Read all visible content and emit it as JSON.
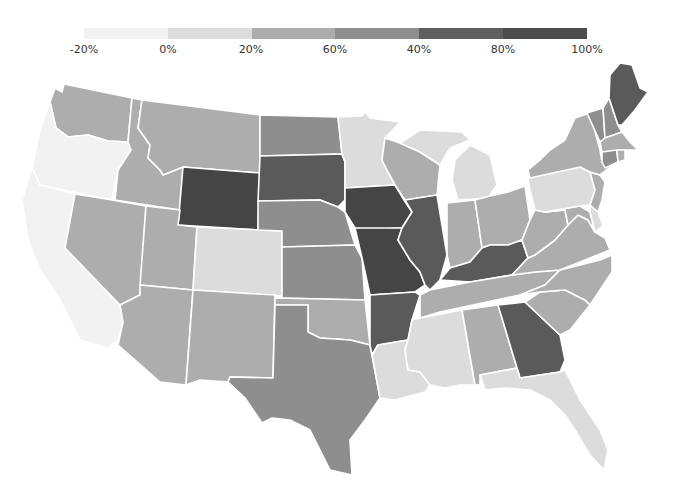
{
  "legend": {
    "segments": [
      {
        "color": "#f2f2f2"
      },
      {
        "color": "#dcdcdc"
      },
      {
        "color": "#adadad"
      },
      {
        "color": "#8e8e8e"
      },
      {
        "color": "#5e5e5e"
      },
      {
        "color": "#4c4c4c"
      }
    ],
    "labels": [
      {
        "text": "-20%",
        "x": 84
      },
      {
        "text": "0%",
        "x": 168
      },
      {
        "text": "20%",
        "x": 251
      },
      {
        "text": "60%",
        "x": 335
      },
      {
        "text": "40%",
        "x": 419
      },
      {
        "text": "80%",
        "x": 503
      },
      {
        "text": "100%",
        "x": 587
      }
    ]
  },
  "levels": {
    "l0": "#f2f2f2",
    "l1": "#dcdcdc",
    "l2": "#adadad",
    "l3": "#8e8e8e",
    "l4": "#5a5a5a",
    "l5": "#454545"
  },
  "states": {
    "WA": "l2",
    "OR": "l0",
    "CA": "l0",
    "ID": "l2",
    "NV": "l2",
    "MT": "l2",
    "WY": "l5",
    "UT": "l2",
    "AZ": "l2",
    "CO": "l1",
    "NM": "l2",
    "ND": "l3",
    "SD": "l4",
    "NE": "l3",
    "KS": "l3",
    "OK": "l2",
    "TX": "l3",
    "MN": "l1",
    "IA": "l5",
    "MO": "l5",
    "AR": "l4",
    "LA": "l1",
    "WI": "l2",
    "IL": "l4",
    "MI": "l1",
    "IN": "l2",
    "OH": "l2",
    "KY": "l4",
    "TN": "l2",
    "MS": "l1",
    "AL": "l2",
    "GA": "l4",
    "FL": "l1",
    "SC": "l2",
    "NC": "l2",
    "VA": "l2",
    "WV": "l2",
    "MD": "l2",
    "DE": "l1",
    "NJ": "l2",
    "PA": "l1",
    "NY": "l2",
    "VT": "l3",
    "NH": "l3",
    "ME": "l4",
    "MA": "l2",
    "CT": "l3",
    "RI": "l2"
  }
}
